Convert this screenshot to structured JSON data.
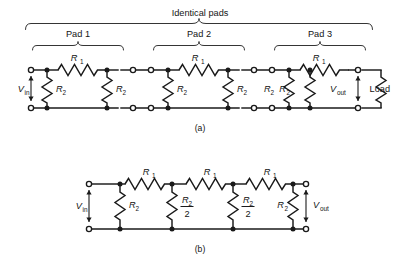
{
  "figure": {
    "caption_a": "(a)",
    "caption_b": "(b)",
    "header": "Identical pads"
  },
  "pads": [
    {
      "name": "Pad 1",
      "series_label": "R",
      "series_sub": "1"
    },
    {
      "name": "Pad 2",
      "series_label": "R",
      "series_sub": "1"
    },
    {
      "name": "Pad 3",
      "series_label": "R",
      "series_sub": "1"
    }
  ],
  "circuit_a": {
    "source_label": "V",
    "source_sub": "in",
    "output_label": "V",
    "output_sub": "out",
    "load_label": "Load",
    "shunt_label": "R",
    "shunt_sub": "2",
    "series_label": "R",
    "series_sub": "1",
    "shunt_count": 6,
    "series_count": 3
  },
  "circuit_b": {
    "source_label": "V",
    "source_sub": "in",
    "output_label": "V",
    "output_sub": "out",
    "series_label": "R",
    "series_sub": "1",
    "series_count": 3,
    "shunt_first": {
      "num": "R",
      "num_sub": "2",
      "den": ""
    },
    "shunt_mid": {
      "num": "R",
      "num_sub": "2",
      "den": "2"
    },
    "shunt_last": {
      "num": "R",
      "num_sub": "2",
      "den": ""
    },
    "shunt_labels": [
      "R2",
      "R2/2",
      "R2/2",
      "R2"
    ]
  },
  "colors": {
    "ink": "#1a1a1a",
    "paper": "#ffffff",
    "brace": "#2a2a2a"
  }
}
